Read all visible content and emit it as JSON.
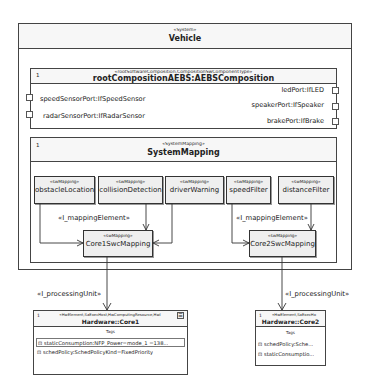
{
  "vehicle": {
    "stereotype": "«System»",
    "title": "Vehicle"
  },
  "root_composition": {
    "multiplicity": "1",
    "stereotype": "«rootSoftwareComposition,CompositionSwComponentType»",
    "title": "rootCompositionAEBS:AEBSComposition",
    "left_ports": [
      "speedSensorPort:IfSpeedSensor",
      "radarSensorPort:IfRadarSensor"
    ],
    "right_ports": [
      "ledPort:IfLED",
      "speakerPort:IfSpeaker",
      "brakePort:IfBrake"
    ]
  },
  "system_mapping": {
    "multiplicity": "1",
    "stereotype": "«SystemMapping»",
    "title": "SystemMapping",
    "sw_mappings": [
      {
        "stereotype": "«swMapping»",
        "name": "obstacleLocation"
      },
      {
        "stereotype": "«swMapping»",
        "name": "collisionDetection"
      },
      {
        "stereotype": "«swMapping»",
        "name": "driverWarning"
      },
      {
        "stereotype": "«swMapping»",
        "name": "speedFilter"
      },
      {
        "stereotype": "«swMapping»",
        "name": "distanceFilter"
      }
    ],
    "core_mappings": [
      {
        "stereotype": "«swMapping»",
        "name": "Core1SwcMapping"
      },
      {
        "stereotype": "«swMapping»",
        "name": "Core2SwcMapping"
      }
    ],
    "edge_labels": [
      "«I_mappingElement»",
      "«I_mappingElement»"
    ]
  },
  "processing_unit_labels": [
    "«I_processingUnit»",
    "«I_processingUnit»"
  ],
  "hardware": [
    {
      "multiplicity": "1",
      "stereotype": "«HwElement,SaExecHost,HwComputingResource,HwI",
      "title": "Hardware::Core1",
      "tags_label": "Tags",
      "tags": [
        "staticConsumption:NFP_Power=mode_1 =138...",
        "schedPolicy:SchedPolicyKind=FixedPriority"
      ]
    },
    {
      "multiplicity": "1",
      "stereotype": "«HwElement,SaExecHo",
      "title": "Hardware::Core2",
      "tags_label": "Tags",
      "tags": [
        "schedPolicy:Sche...",
        "staticConsumptio..."
      ]
    }
  ]
}
